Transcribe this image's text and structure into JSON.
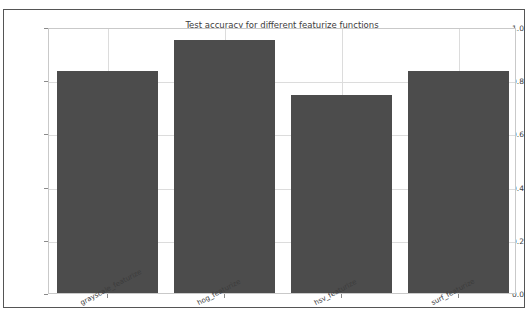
{
  "top_fragment": {
    "text": "· · · · · · · · · ·"
  },
  "chart_data": {
    "type": "bar",
    "title": "Test accuracy for different featurize functions",
    "xlabel": "",
    "ylabel": "",
    "categories": [
      "grayscale_featurize",
      "hog_featurize",
      "hsv_featurize",
      "surf_featurize"
    ],
    "values": [
      0.835,
      0.95,
      0.745,
      0.835
    ],
    "ylim": [
      0.0,
      1.0
    ],
    "yticks": [
      "0.0",
      "0.2",
      "0.4",
      "0.6",
      "0.8",
      "1.0"
    ],
    "ytick_values": [
      0.0,
      0.2,
      0.4,
      0.6,
      0.8,
      1.0
    ],
    "grid": true,
    "legend": null,
    "bar_color": "#4c4c4c",
    "grid_color": "#dcdcdc",
    "axes_color": "#c9c9c9",
    "frame_color": "#555555"
  }
}
